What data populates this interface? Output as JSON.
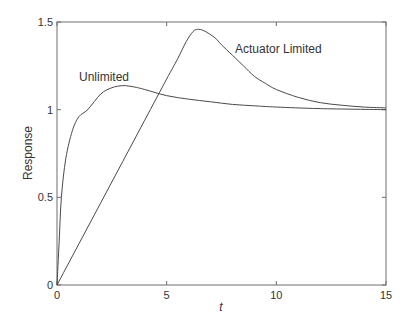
{
  "chart_data": {
    "type": "line",
    "title": "",
    "xlabel": "t",
    "ylabel": "Response",
    "xlim": [
      0,
      15
    ],
    "ylim": [
      0,
      1.5
    ],
    "x_ticks": [
      0,
      5,
      10,
      15
    ],
    "x_tick_labels": [
      "0",
      "5",
      "10",
      "15"
    ],
    "y_ticks": [
      0,
      0.5,
      1,
      1.5
    ],
    "y_tick_labels": [
      "0",
      "0.5",
      "1",
      "1.5"
    ],
    "grid": false,
    "legend": null,
    "annotations": [
      {
        "text": "Unlimited",
        "x": 1.0,
        "y": 1.22
      },
      {
        "text": "Actuator Limited",
        "x": 8.1,
        "y": 1.35
      }
    ],
    "series": [
      {
        "name": "Unlimited",
        "x": [
          0,
          0.1,
          0.2,
          0.4,
          0.7,
          1,
          1.4,
          2,
          2.5,
          3,
          3.5,
          4,
          5,
          6,
          7,
          8,
          9,
          10,
          12,
          15
        ],
        "y": [
          0,
          0.25,
          0.5,
          0.72,
          0.88,
          0.96,
          1.0,
          1.09,
          1.125,
          1.137,
          1.13,
          1.115,
          1.08,
          1.06,
          1.045,
          1.03,
          1.022,
          1.015,
          1.006,
          1.0
        ]
      },
      {
        "name": "Actuator Limited",
        "x": [
          0,
          1,
          2,
          3,
          4,
          5,
          5.5,
          5.9,
          6.2,
          6.4,
          6.7,
          7.2,
          7.5,
          8,
          8.5,
          9,
          9.5,
          10,
          11,
          12,
          13,
          14,
          15
        ],
        "y": [
          0,
          0.235,
          0.47,
          0.705,
          0.94,
          1.175,
          1.29,
          1.39,
          1.445,
          1.458,
          1.45,
          1.41,
          1.37,
          1.31,
          1.25,
          1.19,
          1.15,
          1.115,
          1.07,
          1.04,
          1.025,
          1.015,
          1.01
        ]
      }
    ]
  },
  "labels": {
    "xlabel": "t",
    "ylabel": "Response",
    "annotation_unlimited": "Unlimited",
    "annotation_actuator": "Actuator Limited"
  }
}
